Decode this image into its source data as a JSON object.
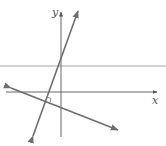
{
  "diagram": {
    "type": "coordinate-plane-lines",
    "axes": {
      "x_label": "x",
      "y_label": "y",
      "color": "#666666"
    },
    "lines": [
      {
        "name": "horizontal-line",
        "color": "#a8a8a8"
      },
      {
        "name": "steep-line",
        "color": "#6e6e6e",
        "arrows": "both"
      },
      {
        "name": "shallow-line",
        "color": "#6e6e6e",
        "arrows": "both"
      }
    ],
    "annotations": [
      {
        "type": "right-angle-marker",
        "location": "intersection of steep-line and shallow-line"
      }
    ]
  }
}
